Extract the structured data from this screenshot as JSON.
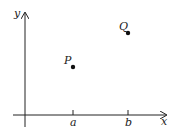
{
  "diagram": {
    "axes": {
      "x_label": "x",
      "y_label": "y"
    },
    "ticks": [
      {
        "label": "a",
        "x": 73
      },
      {
        "label": "b",
        "x": 128
      }
    ],
    "points": [
      {
        "label": "P",
        "x": 73,
        "y": 67
      },
      {
        "label": "Q",
        "x": 128,
        "y": 33
      }
    ],
    "colors": {
      "ink": "#222222",
      "background": "#ffffff"
    }
  }
}
